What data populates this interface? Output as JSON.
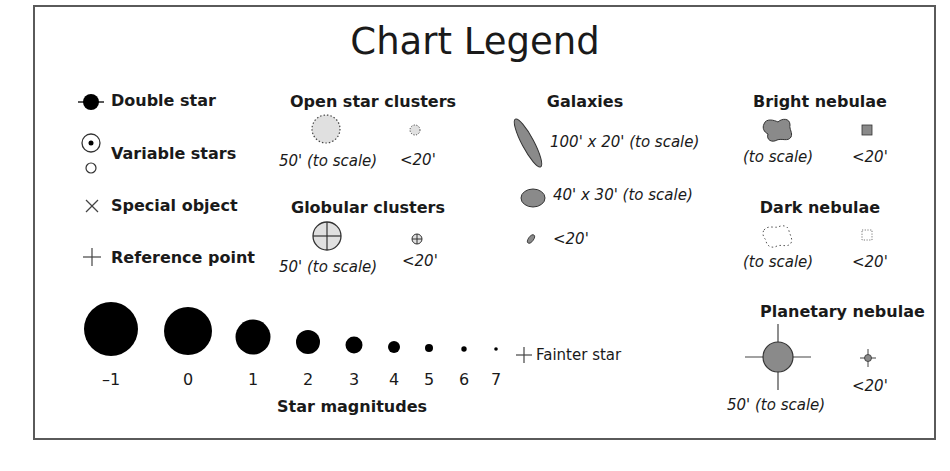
{
  "title": "Chart Legend",
  "symbols": {
    "double_star": "Double star",
    "variable_stars": "Variable stars",
    "special_object": "Special object",
    "reference_point": "Reference point"
  },
  "open_clusters": {
    "heading": "Open star clusters",
    "large": "50' (to scale)",
    "small": "<20'"
  },
  "globular_clusters": {
    "heading": "Globular clusters",
    "large": "50' (to scale)",
    "small": "<20'"
  },
  "galaxies": {
    "heading": "Galaxies",
    "large": "100' x 20' (to scale)",
    "medium": "40' x 30' (to scale)",
    "small": "<20'"
  },
  "bright_nebulae": {
    "heading": "Bright nebulae",
    "large": "(to scale)",
    "small": "<20'"
  },
  "dark_nebulae": {
    "heading": "Dark nebulae",
    "large": "(to scale)",
    "small": "<20'"
  },
  "planetary_nebulae": {
    "heading": "Planetary nebulae",
    "large": "50' (to scale)",
    "small": "<20'"
  },
  "magnitudes": {
    "heading": "Star magnitudes",
    "values": [
      "–1",
      "0",
      "1",
      "2",
      "3",
      "4",
      "5",
      "6",
      "7"
    ],
    "fainter": "Fainter star"
  },
  "colors": {
    "fill_gray": "#8a8a8a",
    "fill_light": "#e0e0e0",
    "stroke": "#3a3a3a"
  }
}
